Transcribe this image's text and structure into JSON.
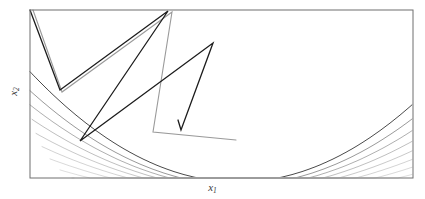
{
  "figure": {
    "title": "",
    "background_color": "#ffffff",
    "width": 425,
    "height": 199
  },
  "axes": {
    "xlabel_main": "x",
    "xlabel_sub": "1",
    "ylabel_main": "x",
    "ylabel_sub": "2",
    "frame_color": "#6f6f6f",
    "frame": {
      "left": 30,
      "top": 10,
      "right": 413,
      "bottom": 178
    },
    "ticks": [],
    "grid": false
  },
  "chart_data": {
    "type": "line",
    "title": "",
    "xlabel": "x1",
    "ylabel": "x2",
    "grid": false,
    "legend": null,
    "xlim": [
      0,
      1
    ],
    "ylim": [
      0,
      1
    ],
    "contours": {
      "style": "nested parabolic banana-shaped level curves opening upward",
      "count": 11,
      "color_dark": "#5a5a5a",
      "color_light": "#d8d8d8",
      "levels_relative": [
        1.0,
        0.86,
        0.74,
        0.62,
        0.52,
        0.43,
        0.35,
        0.28,
        0.22,
        0.16,
        0.11
      ],
      "curves": [
        {
          "level": 1.0,
          "color": "#4a4a4a",
          "width": 1.0,
          "apex_x": 238,
          "apex_y": 182,
          "curvature": 0.00255,
          "x_start": 30,
          "x_end": 413
        },
        {
          "level": 0.86,
          "color": "#8d8d8d",
          "width": 0.9,
          "apex_x": 238,
          "apex_y": 185,
          "curvature": 0.00218,
          "x_start": 30,
          "x_end": 413
        },
        {
          "level": 0.74,
          "color": "#a6a6a6",
          "width": 0.9,
          "apex_x": 239,
          "apex_y": 187,
          "curvature": 0.00188,
          "x_start": 30,
          "x_end": 413
        },
        {
          "level": 0.62,
          "color": "#b4b4b4",
          "width": 0.85,
          "apex_x": 240,
          "apex_y": 189,
          "curvature": 0.00161,
          "x_start": 32,
          "x_end": 413
        },
        {
          "level": 0.52,
          "color": "#bfbfbf",
          "width": 0.85,
          "apex_x": 241,
          "apex_y": 191,
          "curvature": 0.00137,
          "x_start": 36,
          "x_end": 413
        },
        {
          "level": 0.43,
          "color": "#c8c8c8",
          "width": 0.8,
          "apex_x": 242,
          "apex_y": 193,
          "curvature": 0.00116,
          "x_start": 42,
          "x_end": 413
        },
        {
          "level": 0.35,
          "color": "#cfcfcf",
          "width": 0.8,
          "apex_x": 243,
          "apex_y": 195,
          "curvature": 0.00097,
          "x_start": 50,
          "x_end": 413
        },
        {
          "level": 0.28,
          "color": "#d5d5d5",
          "width": 0.8,
          "apex_x": 244,
          "apex_y": 197,
          "curvature": 0.0008,
          "x_start": 60,
          "x_end": 413
        },
        {
          "level": 0.22,
          "color": "#dadada",
          "width": 0.75,
          "apex_x": 245,
          "apex_y": 199,
          "curvature": 0.00065,
          "x_start": 72,
          "x_end": 413
        },
        {
          "level": 0.16,
          "color": "#dfdfdf",
          "width": 0.75,
          "apex_x": 246,
          "apex_y": 201,
          "curvature": 0.00052,
          "x_start": 86,
          "x_end": 413
        },
        {
          "level": 0.11,
          "color": "#e4e4e4",
          "width": 0.75,
          "apex_x": 247,
          "apex_y": 203,
          "curvature": 0.0004,
          "x_start": 104,
          "x_end": 413
        }
      ]
    },
    "trajectory": {
      "name": "steepest-descent iterate path",
      "color": "#1c1c1c",
      "width": 1.3,
      "marker": "none",
      "points": [
        [
          30,
          10
        ],
        [
          60,
          90
        ],
        [
          168,
          11
        ],
        [
          80,
          141
        ],
        [
          213,
          43
        ],
        [
          181,
          130
        ],
        [
          178,
          120
        ]
      ]
    },
    "secondary_trajectory": {
      "name": "faded alternate iterate path",
      "color": "#9a9a9a",
      "width": 1.1,
      "points": [
        [
          33,
          10
        ],
        [
          62,
          92
        ],
        [
          172,
          12
        ],
        [
          153,
          132
        ],
        [
          236,
          140
        ]
      ]
    }
  }
}
